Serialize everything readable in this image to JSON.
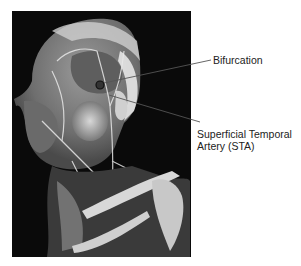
{
  "figure": {
    "background_color": "#0a0a0a",
    "marker": "bifurcation-circle"
  },
  "labels": {
    "bifurcation": "Bifurcation",
    "sta_line1": "Superficial Temporal",
    "sta_line2": "Artery (STA)"
  }
}
